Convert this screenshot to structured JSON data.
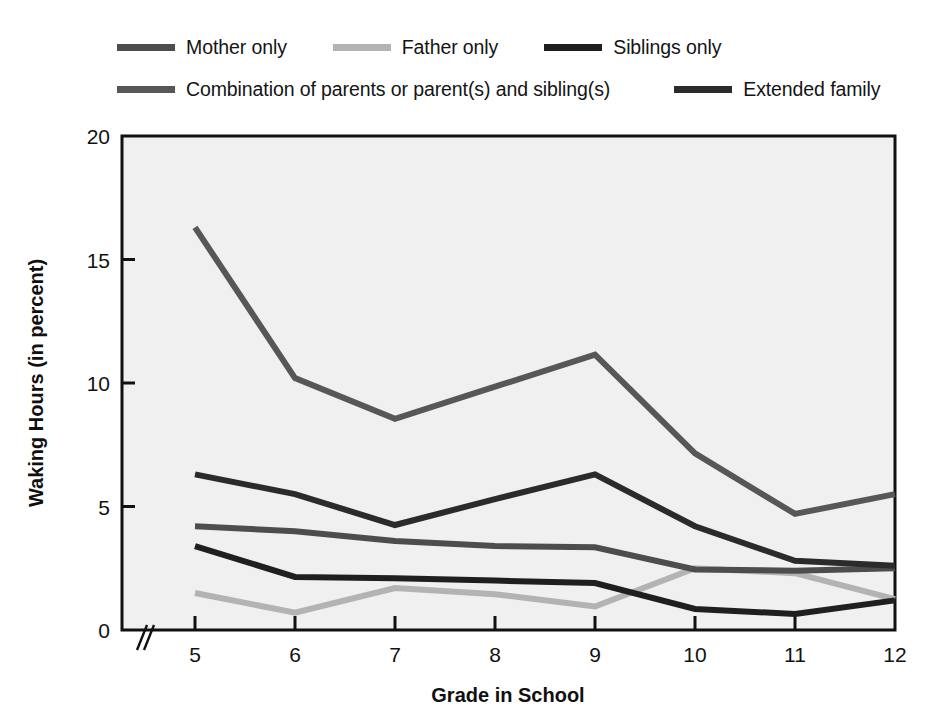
{
  "chart_data": {
    "type": "line",
    "title": "",
    "xlabel": "Grade in School",
    "ylabel": "Waking Hours (in percent)",
    "x": [
      5,
      6,
      7,
      8,
      9,
      10,
      11,
      12
    ],
    "categories": [
      "5",
      "6",
      "7",
      "8",
      "9",
      "10",
      "11",
      "12"
    ],
    "xtick_labels": [
      "5",
      "6",
      "7",
      "8",
      "9",
      "10",
      "11",
      "12"
    ],
    "ytick_labels": [
      "0",
      "5",
      "10",
      "15",
      "20"
    ],
    "yticks": [
      0,
      5,
      10,
      15,
      20
    ],
    "ylim": [
      0,
      20
    ],
    "xlim": [
      5,
      12
    ],
    "grid": false,
    "axis_break": "//",
    "legend_position": "above-plot",
    "plot_background": "#f0f0f0",
    "series": [
      {
        "name": "Mother only",
        "color": "#4d4d4d",
        "values": [
          4.2,
          4.0,
          3.6,
          3.4,
          3.35,
          2.45,
          2.4,
          2.5
        ]
      },
      {
        "name": "Father only",
        "color": "#b3b3b3",
        "values": [
          1.5,
          0.7,
          1.7,
          1.45,
          0.95,
          2.5,
          2.3,
          1.25
        ]
      },
      {
        "name": "Siblings only",
        "color": "#1f1f1f",
        "values": [
          3.4,
          2.15,
          2.1,
          2.0,
          1.9,
          0.85,
          0.65,
          1.2
        ]
      },
      {
        "name": "Combination of parents or parent(s) and sibling(s)",
        "color": "#575757",
        "values": [
          16.3,
          10.2,
          8.55,
          9.85,
          11.15,
          7.15,
          4.7,
          5.5
        ]
      },
      {
        "name": "Extended family",
        "color": "#2b2b2b",
        "values": [
          6.3,
          5.5,
          4.25,
          5.3,
          6.3,
          4.2,
          2.8,
          2.6
        ]
      }
    ]
  },
  "legend": {
    "row1": [
      {
        "label": "Mother only",
        "color": "#4d4d4d"
      },
      {
        "label": "Father only",
        "color": "#b3b3b3"
      },
      {
        "label": "Siblings only",
        "color": "#1f1f1f"
      }
    ],
    "row2": [
      {
        "label": "Combination of parents or parent(s) and sibling(s)",
        "color": "#575757"
      },
      {
        "label": "Extended family",
        "color": "#2b2b2b"
      }
    ]
  },
  "axes": {
    "y_title": "Waking Hours (in percent)",
    "x_title": "Grade in School"
  }
}
